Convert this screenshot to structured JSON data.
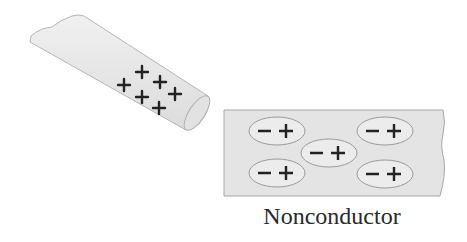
{
  "diagram": {
    "rod": {
      "charge_signs": [
        "+",
        "+",
        "+",
        "+",
        "+",
        "+"
      ]
    },
    "nonconductor": {
      "label": "Nonconductor",
      "dipoles": [
        {
          "neg": "−",
          "pos": "+"
        },
        {
          "neg": "−",
          "pos": "+"
        },
        {
          "neg": "−",
          "pos": "+"
        },
        {
          "neg": "−",
          "pos": "+"
        },
        {
          "neg": "−",
          "pos": "+"
        }
      ]
    },
    "colors": {
      "fill": "#e6e6e6",
      "stroke": "#9a9a9a",
      "ink": "#222222"
    }
  }
}
